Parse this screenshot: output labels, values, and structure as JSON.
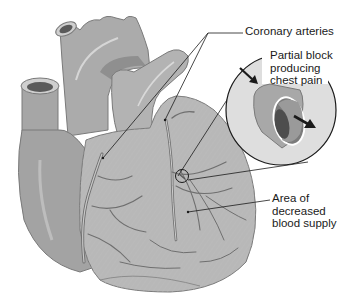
{
  "figure": {
    "cropped_top_text": "supply of oxygen...",
    "colors": {
      "background": "#ffffff",
      "heart_fill": "#a9a9a9",
      "heart_light": "#c4c4c4",
      "heart_dark": "#8a8a8a",
      "vessel_stroke": "#6f6f6f",
      "inset_fill": "#e0e0e0",
      "outline": "#1a1a1a"
    }
  },
  "labels": {
    "coronary_arteries": "Coronary arteries",
    "partial_block": [
      "Partial block",
      "producing",
      "chest pain"
    ],
    "decreased_supply": [
      "Area of",
      "decreased",
      "blood supply"
    ]
  },
  "inset": {
    "description": "Magnified cross-section of artery showing partial blockage",
    "arrows": [
      "blood-flow-in-arrow",
      "blood-flow-out-arrow"
    ]
  }
}
